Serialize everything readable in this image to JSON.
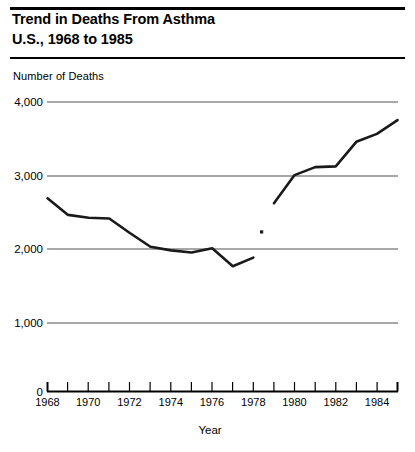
{
  "header": {
    "title_line1": "Trend in Deaths From Asthma",
    "title_line2": "U.S., 1968 to 1985"
  },
  "chart_data": {
    "type": "line",
    "title": "Trend in Deaths From Asthma U.S., 1968 to 1985",
    "subtitle": "",
    "xlabel": "Year",
    "ylabel": "Number of Deaths",
    "ylabel_position": "above-axis",
    "ylim": [
      0,
      4000
    ],
    "xlim": [
      1968,
      1985
    ],
    "yticks": [
      0,
      1000,
      2000,
      3000,
      4000
    ],
    "ytick_labels": [
      "0",
      "1,000",
      "2,000",
      "3,000",
      "4,000"
    ],
    "xticks": [
      1968,
      1969,
      1970,
      1971,
      1972,
      1973,
      1974,
      1975,
      1976,
      1977,
      1978,
      1979,
      1980,
      1981,
      1982,
      1983,
      1984,
      1985
    ],
    "xtick_labels": [
      "1968",
      "",
      "1970",
      "",
      "1972",
      "",
      "1974",
      "",
      "1976",
      "",
      "1978",
      "",
      "1980",
      "",
      "1982",
      "",
      "1984",
      ""
    ],
    "grid": "horizontal",
    "legend": "none",
    "series": [
      {
        "name": "Deaths from asthma (ICD-8, 1968-1978)",
        "x": [
          1968,
          1969,
          1970,
          1971,
          1972,
          1973,
          1974,
          1975,
          1976,
          1977,
          1978
        ],
        "values": [
          2670,
          2440,
          2400,
          2390,
          2190,
          2000,
          1950,
          1920,
          1980,
          1730,
          1850
        ]
      },
      {
        "name": "Deaths from asthma (ICD-9, 1979-1985)",
        "x": [
          1979,
          1980,
          1981,
          1982,
          1983,
          1984,
          1985
        ],
        "values": [
          2600,
          2990,
          3100,
          3110,
          3450,
          3560,
          3750
        ]
      }
    ],
    "markers": [
      {
        "name": "isolated-point",
        "x": 1978.4,
        "y": 2205
      }
    ],
    "note": "Series break between 1978 and 1979 (coding revision)"
  },
  "colors": {
    "line": "#1a1a1a",
    "grid": "#888888",
    "axis": "#000000",
    "background": "#ffffff"
  }
}
